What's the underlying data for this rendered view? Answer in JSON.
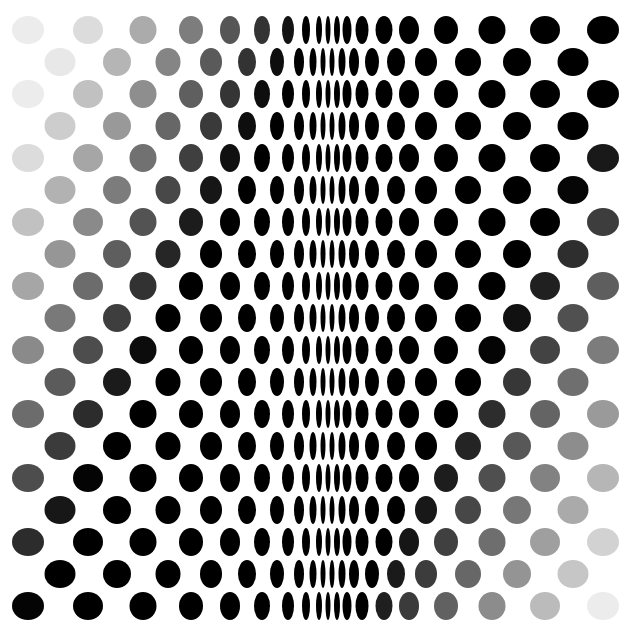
{
  "artwork": {
    "title": "Op-art dot field",
    "description": "Staggered rows of ellipses compressing toward a central vertical band, with a diagonal grey-to-black gradient",
    "width": 637,
    "height": 632,
    "background": "#ffffff",
    "ink": "#000000",
    "light_grey": "#eeeeee",
    "row_y": [
      30,
      62,
      94,
      126,
      158,
      190,
      222,
      254,
      286,
      318,
      350,
      382,
      414,
      446,
      478,
      510,
      542,
      574,
      606
    ],
    "dot_height": 30,
    "even_rows": {
      "cx": [
        28,
        88,
        143,
        191,
        230,
        262,
        288,
        306,
        319,
        328,
        337,
        347,
        362,
        384,
        409,
        446,
        492,
        545,
        603
      ],
      "w": [
        32,
        30,
        27,
        24,
        20,
        16,
        12,
        8,
        6,
        5,
        6,
        9,
        13,
        17,
        20,
        24,
        27,
        30,
        32
      ]
    },
    "odd_rows": {
      "cx": [
        60,
        117,
        168,
        211,
        247,
        277,
        299,
        313,
        323,
        332,
        342,
        354,
        372,
        396,
        426,
        468,
        517,
        573
      ],
      "w": [
        31,
        28,
        25,
        22,
        18,
        14,
        10,
        7,
        5,
        5,
        7,
        10,
        14,
        18,
        22,
        26,
        28,
        31
      ]
    },
    "gradient": {
      "left_black_edge_top": 300,
      "left_black_edge_step": 15,
      "left_fade_span": 230,
      "right_black_edge_top": 650,
      "right_black_edge_step": 16,
      "right_fade_span": 240
    }
  }
}
